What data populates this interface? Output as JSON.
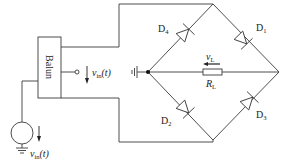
{
  "diagram": {
    "type": "circuit",
    "colors": {
      "line": "#3a3a3a",
      "background": "#ffffff"
    },
    "blocks": [
      {
        "id": "balun",
        "label": "Balun"
      }
    ],
    "source": {
      "symbol": "ac-voltage-source",
      "label_main": "v",
      "label_sub": "in",
      "label_arg": "(t)"
    },
    "balun_output": {
      "label_main": "v",
      "label_sub": "in",
      "label_arg": "(t)"
    },
    "diodes": [
      {
        "id": "D4",
        "label_main": "D",
        "label_sub": "4"
      },
      {
        "id": "D1",
        "label_main": "D",
        "label_sub": "1"
      },
      {
        "id": "D2",
        "label_main": "D",
        "label_sub": "2"
      },
      {
        "id": "D3",
        "label_main": "D",
        "label_sub": "3"
      }
    ],
    "load": {
      "resistor_main": "R",
      "resistor_sub": "L",
      "voltage_main": "v",
      "voltage_sub": "L"
    },
    "grounds": [
      "source-ground",
      "center-node-ground"
    ]
  }
}
